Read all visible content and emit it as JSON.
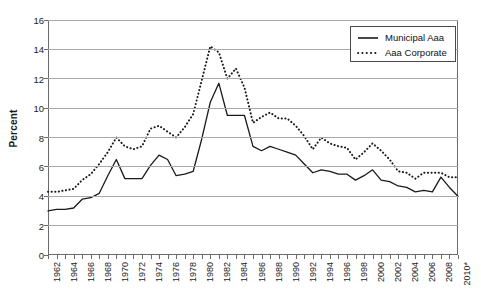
{
  "chart_data": {
    "type": "line",
    "title": "",
    "xlabel": "",
    "ylabel": "Percent",
    "ylim": [
      0,
      16
    ],
    "ytick_step": 2,
    "yticks": [
      0,
      2,
      4,
      6,
      8,
      10,
      12,
      14,
      16
    ],
    "grid": "horizontal",
    "legend_position": "top-right",
    "x": [
      1962,
      1963,
      1964,
      1965,
      1966,
      1967,
      1968,
      1969,
      1970,
      1971,
      1972,
      1973,
      1974,
      1975,
      1976,
      1977,
      1978,
      1979,
      1980,
      1981,
      1982,
      1983,
      1984,
      1985,
      1986,
      1987,
      1988,
      1989,
      1990,
      1991,
      1992,
      1993,
      1994,
      1995,
      1996,
      1997,
      1998,
      1999,
      2000,
      2001,
      2002,
      2003,
      2004,
      2005,
      2006,
      2007,
      2008,
      2009,
      2010
    ],
    "xtick_labels": [
      "1962",
      "1964",
      "1966",
      "1968",
      "1970",
      "1972",
      "1974",
      "1976",
      "1978",
      "1980",
      "1982",
      "1984",
      "1986",
      "1988",
      "1990",
      "1992",
      "1994",
      "1996",
      "1998",
      "2000",
      "2002",
      "2004",
      "2006",
      "2008",
      "2010*"
    ],
    "xtick_label_years": [
      1962,
      1964,
      1966,
      1968,
      1970,
      1972,
      1974,
      1976,
      1978,
      1980,
      1982,
      1984,
      1986,
      1988,
      1990,
      1992,
      1994,
      1996,
      1998,
      2000,
      2002,
      2004,
      2006,
      2008,
      2010
    ],
    "series": [
      {
        "name": "Municipal Aaa",
        "style": "solid",
        "color": "#1a1a1a",
        "values": [
          3.0,
          3.1,
          3.1,
          3.2,
          3.8,
          3.9,
          4.2,
          5.4,
          6.5,
          5.2,
          5.2,
          5.2,
          6.1,
          6.8,
          6.5,
          5.4,
          5.5,
          5.7,
          7.9,
          10.4,
          11.7,
          9.5,
          9.5,
          9.5,
          7.4,
          7.1,
          7.4,
          7.2,
          7.0,
          6.8,
          6.2,
          5.6,
          5.8,
          5.7,
          5.5,
          5.5,
          5.1,
          5.4,
          5.8,
          5.1,
          5.0,
          4.7,
          4.6,
          4.3,
          4.4,
          4.3,
          5.3,
          4.6,
          4.0
        ]
      },
      {
        "name": "Aaa Corporate",
        "style": "dotted",
        "color": "#1a1a1a",
        "values": [
          4.3,
          4.3,
          4.4,
          4.5,
          5.1,
          5.5,
          6.2,
          7.0,
          8.0,
          7.4,
          7.2,
          7.4,
          8.6,
          8.8,
          8.4,
          8.0,
          8.7,
          9.6,
          11.9,
          14.2,
          13.8,
          12.0,
          12.7,
          11.4,
          9.0,
          9.4,
          9.7,
          9.3,
          9.3,
          8.8,
          8.1,
          7.2,
          8.0,
          7.6,
          7.4,
          7.3,
          6.5,
          7.0,
          7.6,
          7.1,
          6.5,
          5.7,
          5.6,
          5.2,
          5.6,
          5.6,
          5.6,
          5.3,
          5.3
        ]
      }
    ]
  }
}
